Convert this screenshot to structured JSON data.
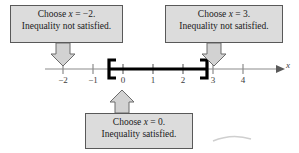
{
  "figure": {
    "type": "number-line-test-intervals",
    "axis_variable": "x"
  },
  "number_line": {
    "tick_labels": [
      "−2",
      "−1",
      "0",
      "1",
      "2",
      "3",
      "4"
    ],
    "tick_values": [
      -2,
      -1,
      0,
      1,
      2,
      3,
      4
    ],
    "axis_min": -2.6,
    "axis_max": 4.6,
    "solution_interval": {
      "left_endpoint_label": "[",
      "right_endpoint_label": "]",
      "left_value": -0.4,
      "right_value": 2.5,
      "style": "closed"
    },
    "colors": {
      "axis": "#8c8c8c",
      "interval": "#000000",
      "box_fill": "#dcdcdc",
      "box_border": "#595959",
      "text": "#1a1a1a"
    }
  },
  "callouts": {
    "left": {
      "line1_prefix": "Choose ",
      "line1_var": "x",
      "line1_suffix": " = −2.",
      "line2": "Inequality not satisfied.",
      "points_to": -2
    },
    "right": {
      "line1_prefix": "Choose ",
      "line1_var": "x",
      "line1_suffix": " = 3.",
      "line2": "Inequality not satisfied.",
      "points_to": 3
    },
    "bottom": {
      "line1_prefix": "Choose ",
      "line1_var": "x",
      "line1_suffix": " = 0.",
      "line2": "Inequality satisfied.",
      "points_to": 0
    }
  }
}
